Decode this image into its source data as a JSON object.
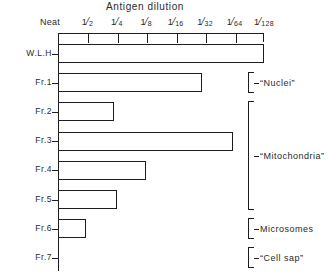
{
  "chart_data": {
    "type": "bar",
    "orientation": "horizontal",
    "title": "Antigen dilution",
    "xlabel": "Antigen dilution",
    "ylabel": "",
    "grid": false,
    "legend": null,
    "x_tick_labels": [
      "Neat",
      "1/2",
      "1/4",
      "1/8",
      "1/16",
      "1/32",
      "1/64",
      "1/128"
    ],
    "x_tick_numerators": [
      "Neat",
      "1",
      "1",
      "1",
      "1",
      "1",
      "1",
      "1"
    ],
    "x_tick_denominators": [
      "",
      "2",
      "4",
      "8",
      "16",
      "32",
      "64",
      "128"
    ],
    "x_axis_steps": 7,
    "categories": [
      "W.L.H",
      "Fr.1",
      "Fr.2",
      "Fr.3",
      "Fr.4",
      "Fr.5",
      "Fr.6",
      "Fr.7"
    ],
    "values": [
      7.0,
      4.9,
      1.9,
      5.95,
      3.0,
      2.0,
      0.95,
      0
    ],
    "endpoint_titres": [
      "1/128",
      "1/32",
      "1/4",
      "1/64",
      "1/8",
      "1/4",
      "1/2",
      "Neat"
    ],
    "groups": [
      {
        "label": "“Nuclei”",
        "from": 1,
        "to": 1
      },
      {
        "label": "“Mitochondria”",
        "from": 2,
        "to": 5
      },
      {
        "label": "Microsomes",
        "from": 6,
        "to": 6
      },
      {
        "label": "“Cell sap”",
        "from": 7,
        "to": 7
      }
    ]
  }
}
